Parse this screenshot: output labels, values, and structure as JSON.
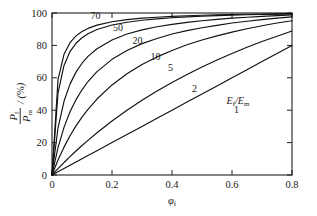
{
  "chart_data": {
    "type": "line",
    "title": "",
    "subtitle": "",
    "xlabel": "φf",
    "ylabel": "Pf/Pm / (%)",
    "xlim": [
      0,
      0.8
    ],
    "ylim": [
      0,
      100
    ],
    "grid": false,
    "legend_position": "inline-curve-labels",
    "xticks": [
      "0",
      "0.2",
      "0.4",
      "0.6",
      "0.8"
    ],
    "xtick_values": [
      0,
      0.2,
      0.4,
      0.6,
      0.8
    ],
    "yticks": [
      "0",
      "20",
      "40",
      "60",
      "80",
      "100"
    ],
    "ytick_values": [
      0,
      20,
      40,
      60,
      80,
      100
    ],
    "annotation": "Ef/Em",
    "annotation_x": 0.62,
    "annotation_y": 44,
    "x": [
      0,
      0.02,
      0.04,
      0.06,
      0.08,
      0.1,
      0.12,
      0.15,
      0.2,
      0.25,
      0.3,
      0.35,
      0.4,
      0.45,
      0.5,
      0.55,
      0.6,
      0.65,
      0.7,
      0.75,
      0.8
    ],
    "series": [
      {
        "name": "70",
        "label": "70",
        "label_x": 0.145,
        "label_y": 96,
        "values": [
          0,
          58.8,
          74.5,
          81.7,
          85.9,
          88.6,
          90.5,
          92.5,
          94.6,
          95.9,
          96.8,
          97.4,
          97.9,
          98.3,
          98.6,
          98.8,
          99.1,
          99.2,
          99.4,
          99.5,
          99.6
        ]
      },
      {
        "name": "50",
        "label": "50",
        "label_x": 0.22,
        "label_y": 89,
        "values": [
          0,
          50.5,
          67.6,
          76.2,
          81.3,
          84.7,
          87.2,
          89.8,
          92.6,
          94.3,
          95.5,
          96.4,
          97.1,
          97.6,
          98.0,
          98.4,
          98.7,
          98.9,
          99.1,
          99.3,
          99.5
        ]
      },
      {
        "name": "20",
        "label": "20",
        "label_x": 0.285,
        "label_y": 81,
        "values": [
          0,
          29.0,
          45.5,
          56.1,
          63.5,
          69.0,
          73.2,
          77.9,
          83.3,
          87.0,
          89.6,
          91.5,
          93.0,
          94.2,
          95.2,
          96.1,
          96.8,
          97.4,
          97.9,
          98.4,
          98.8
        ]
      },
      {
        "name": "10",
        "label": "10",
        "label_x": 0.345,
        "label_y": 71,
        "values": [
          0,
          16.9,
          29.4,
          39.0,
          46.5,
          52.6,
          57.7,
          63.8,
          71.4,
          76.9,
          81.1,
          84.3,
          87.0,
          89.1,
          90.9,
          92.4,
          93.8,
          94.9,
          95.9,
          96.8,
          97.6
        ]
      },
      {
        "name": "5",
        "label": "5",
        "label_x": 0.395,
        "label_y": 64,
        "values": [
          0,
          9.3,
          17.2,
          24.2,
          30.3,
          35.7,
          40.5,
          46.9,
          55.6,
          62.5,
          68.2,
          72.9,
          76.9,
          80.4,
          83.3,
          85.9,
          88.2,
          90.3,
          92.1,
          93.8,
          95.2
        ]
      },
      {
        "name": "2",
        "label": "2",
        "label_x": 0.475,
        "label_y": 51,
        "values": [
          0,
          3.9,
          7.7,
          11.3,
          14.8,
          18.2,
          21.4,
          26.1,
          33.3,
          40.0,
          46.2,
          51.9,
          57.1,
          62.1,
          66.7,
          71.0,
          75.0,
          78.8,
          82.4,
          85.7,
          88.9
        ]
      },
      {
        "name": "1",
        "label": "1",
        "label_x": 0.615,
        "label_y": 38,
        "values": [
          0,
          2.0,
          4.0,
          6.0,
          8.0,
          10.0,
          12.0,
          15.0,
          20.0,
          25.0,
          30.0,
          35.0,
          40.0,
          45.0,
          50.0,
          55.0,
          60.0,
          65.0,
          70.0,
          75.0,
          80.0
        ]
      }
    ]
  }
}
